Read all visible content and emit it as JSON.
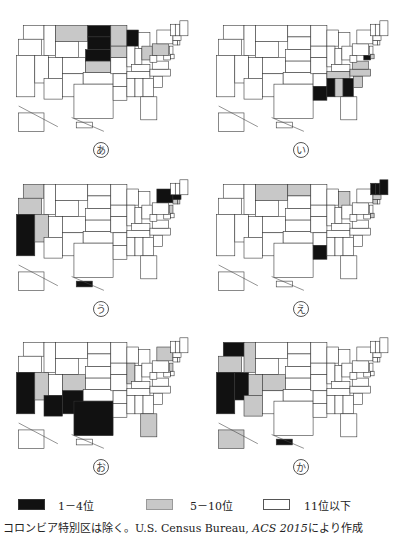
{
  "chart_data": {
    "type": "choropleth-map",
    "title": "",
    "region": "United States (50 states, excluding District of Columbia)",
    "legend": [
      {
        "key": "top",
        "label": "1－4位",
        "color": "#111111"
      },
      {
        "key": "mid",
        "label": "5－10位",
        "color": "#c8c8c8"
      },
      {
        "key": "low",
        "label": "11位以下",
        "color": "#ffffff"
      }
    ],
    "maps": [
      {
        "label": "あ",
        "rank_1_4": [
          "North Dakota",
          "South Dakota",
          "Nebraska",
          "Wisconsin"
        ],
        "rank_5_10": [
          "Montana",
          "Minnesota",
          "Iowa",
          "Kansas",
          "Ohio",
          "Pennsylvania"
        ]
      },
      {
        "label": "い",
        "rank_1_4": [
          "Mississippi",
          "Louisiana",
          "Georgia",
          "Maryland"
        ],
        "rank_5_10": [
          "Alabama",
          "South Carolina",
          "North Carolina",
          "Virginia",
          "Tennessee",
          "Delaware"
        ]
      },
      {
        "label": "う",
        "rank_1_4": [
          "California",
          "New York",
          "Massachusetts",
          "Hawaii"
        ],
        "rank_5_10": [
          "Washington",
          "Oregon",
          "Nevada",
          "Connecticut",
          "New Jersey",
          "Rhode Island"
        ]
      },
      {
        "label": "え",
        "rank_1_4": [
          "Maine",
          "New Hampshire",
          "Vermont",
          "Louisiana"
        ],
        "rank_5_10": [
          "Montana",
          "North Dakota",
          "Michigan",
          "Massachusetts",
          "Connecticut",
          "Delaware"
        ]
      },
      {
        "label": "お",
        "rank_1_4": [
          "California",
          "Arizona",
          "New Mexico",
          "Texas"
        ],
        "rank_5_10": [
          "Nevada",
          "Colorado",
          "Illinois",
          "Florida",
          "New York",
          "New Jersey"
        ]
      },
      {
        "label": "か",
        "rank_1_4": [
          "Washington",
          "California",
          "Nevada",
          "Hawaii"
        ],
        "rank_5_10": [
          "Oregon",
          "Idaho",
          "Utah",
          "Colorado",
          "Arizona",
          "Alaska"
        ]
      }
    ]
  },
  "legend": {
    "items": [
      {
        "label": "1－4位"
      },
      {
        "label": "5－10位"
      },
      {
        "label": "11位以下"
      }
    ]
  },
  "source": {
    "prefix": "コロンビア特別区は除く。U.S. Census Bureau, ",
    "title": "ACS 2015",
    "suffix": "により作成"
  },
  "panels": [
    {
      "label": "あ"
    },
    {
      "label": "い"
    },
    {
      "label": "う"
    },
    {
      "label": "え"
    },
    {
      "label": "お"
    },
    {
      "label": "か"
    }
  ]
}
